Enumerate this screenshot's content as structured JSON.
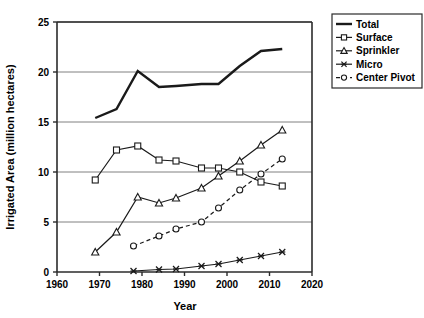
{
  "chart_data": {
    "type": "line",
    "title": "",
    "xlabel": "Year",
    "ylabel": "Irrigated Area (million hectares)",
    "xlim": [
      1960,
      2020
    ],
    "ylim": [
      0,
      25
    ],
    "xticks": [
      1960,
      1970,
      1980,
      1990,
      2000,
      2010,
      2020
    ],
    "yticks": [
      0,
      5,
      10,
      15,
      20,
      25
    ],
    "grid": "horizontal",
    "legend_position": "right-top",
    "series": [
      {
        "name": "Total",
        "marker": "none",
        "dash": "solid",
        "color": "#1a1a1a",
        "x": [
          1969,
          1974,
          1979,
          1984,
          1988,
          1994,
          1998,
          2003,
          2008,
          2013
        ],
        "values": [
          15.4,
          16.3,
          20.1,
          18.5,
          18.6,
          18.8,
          18.8,
          20.6,
          22.1,
          22.3
        ]
      },
      {
        "name": "Surface",
        "marker": "square",
        "dash": "solid",
        "color": "#1a1a1a",
        "x": [
          1969,
          1974,
          1979,
          1984,
          1988,
          1994,
          1998,
          2003,
          2008,
          2013
        ],
        "values": [
          9.2,
          12.2,
          12.6,
          11.2,
          11.1,
          10.4,
          10.4,
          10.0,
          9.0,
          8.6
        ]
      },
      {
        "name": "Sprinkler",
        "marker": "triangle",
        "dash": "solid",
        "color": "#1a1a1a",
        "x": [
          1969,
          1974,
          1979,
          1984,
          1988,
          1994,
          1998,
          2003,
          2008,
          2013
        ],
        "values": [
          2.0,
          4.0,
          7.5,
          6.9,
          7.4,
          8.4,
          9.6,
          11.1,
          12.7,
          14.2
        ]
      },
      {
        "name": "Micro",
        "marker": "cross",
        "dash": "solid",
        "color": "#1a1a1a",
        "x": [
          1978,
          1984,
          1988,
          1994,
          1998,
          2003,
          2008,
          2013
        ],
        "values": [
          0.1,
          0.25,
          0.3,
          0.6,
          0.8,
          1.2,
          1.6,
          2.0
        ]
      },
      {
        "name": "Center Pivot",
        "marker": "circle",
        "dash": "dashed",
        "color": "#1a1a1a",
        "x": [
          1978,
          1984,
          1988,
          1994,
          1998,
          2003,
          2008,
          2013
        ],
        "values": [
          2.6,
          3.6,
          4.3,
          5.0,
          6.4,
          8.2,
          9.8,
          11.3
        ]
      }
    ]
  },
  "legend": {
    "items": [
      {
        "label": "Total"
      },
      {
        "label": "Surface"
      },
      {
        "label": "Sprinkler"
      },
      {
        "label": "Micro"
      },
      {
        "label": "Center Pivot"
      }
    ]
  },
  "axes": {
    "x_title": "Year",
    "y_title": "Irrigated Area (million hectares)",
    "x_tick_labels": [
      "1960",
      "1970",
      "1980",
      "1990",
      "2000",
      "2010",
      "2020"
    ],
    "y_tick_labels": [
      "0",
      "5",
      "10",
      "15",
      "20",
      "25"
    ]
  },
  "style": {
    "line_color": "#1a1a1a",
    "grid_color": "#808080",
    "frame_color": "#2b2b2b",
    "background": "#ffffff"
  }
}
